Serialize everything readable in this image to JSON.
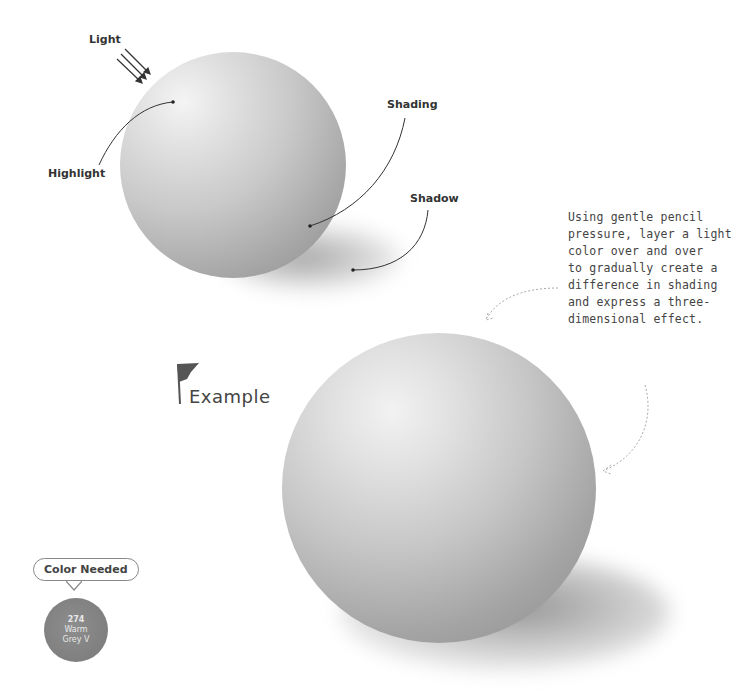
{
  "diagram": {
    "labels": {
      "light": "Light",
      "highlight": "Highlight",
      "shading": "Shading",
      "shadow": "Shadow"
    }
  },
  "note": {
    "text": "Using gentle pencil\npressure, layer a light\ncolor over and over\nto gradually create a\ndifference in shading\nand express a three-\ndimensional effect."
  },
  "example": {
    "heading": "Example"
  },
  "color_needed": {
    "title": "Color Needed",
    "swatch_number": "274",
    "swatch_name_line1": "Warm",
    "swatch_name_line2": "Grey V",
    "swatch_color": "#858585"
  }
}
